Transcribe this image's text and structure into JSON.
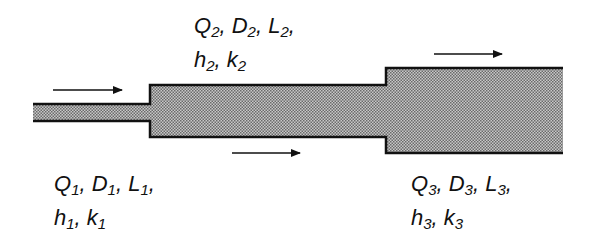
{
  "diagram": {
    "colors": {
      "pipe_fill": "#a8a8a8",
      "pipe_wall": "#111111",
      "background": "#ffffff"
    },
    "pipes": [
      {
        "id": 1,
        "x0": 33,
        "x1": 150,
        "y0": 104,
        "y1": 121
      },
      {
        "id": 2,
        "x0": 150,
        "x1": 386,
        "y0": 85,
        "y1": 137
      },
      {
        "id": 3,
        "x0": 386,
        "x1": 563,
        "y0": 68,
        "y1": 153
      }
    ],
    "arrows": [
      {
        "name": "flow-arrow-1",
        "x0": 53,
        "x1": 122,
        "y": 90
      },
      {
        "name": "flow-arrow-2",
        "x0": 232,
        "x1": 300,
        "y": 153
      },
      {
        "name": "flow-arrow-3",
        "x0": 434,
        "x1": 502,
        "y": 54
      }
    ],
    "labels": {
      "pipe1": {
        "line1": [
          "Q",
          "1",
          ", D",
          "1",
          ", L",
          "1",
          ","
        ],
        "line2": [
          "h",
          "1",
          ", k",
          "1"
        ]
      },
      "pipe2": {
        "line1": [
          "Q",
          "2",
          ", D",
          "2",
          ", L",
          "2",
          ","
        ],
        "line2": [
          "h",
          "2",
          ", k",
          "2"
        ]
      },
      "pipe3": {
        "line1": [
          "Q",
          "3",
          ", D",
          "3",
          ", L",
          "3",
          ","
        ],
        "line2": [
          "h",
          "3",
          ", k",
          "3"
        ]
      }
    }
  }
}
